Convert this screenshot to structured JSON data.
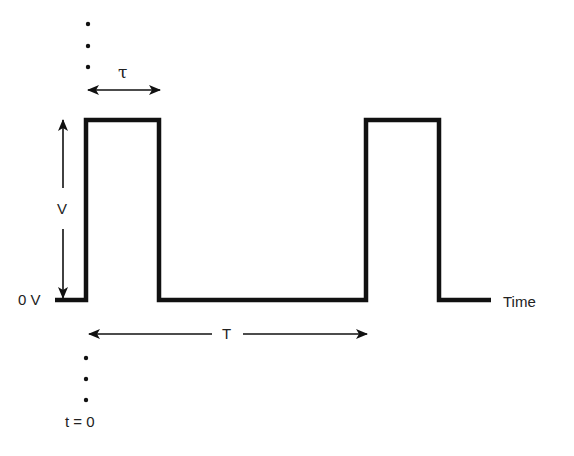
{
  "diagram": {
    "type": "pulse-waveform",
    "labels": {
      "pulse_width": "τ",
      "amplitude": "V",
      "baseline": "0 V",
      "period": "T",
      "time_axis": "Time",
      "time_origin": "t = 0"
    },
    "colors": {
      "waveform": "#111111",
      "arrows": "#111111",
      "text": "#222222",
      "background": "#ffffff"
    },
    "waveform": {
      "baseline_y": 300,
      "high_y": 120,
      "start_x": 55,
      "end_x": 491,
      "pulses": [
        {
          "rise_x": 86,
          "fall_x": 159
        },
        {
          "rise_x": 366,
          "fall_x": 439
        }
      ]
    }
  }
}
